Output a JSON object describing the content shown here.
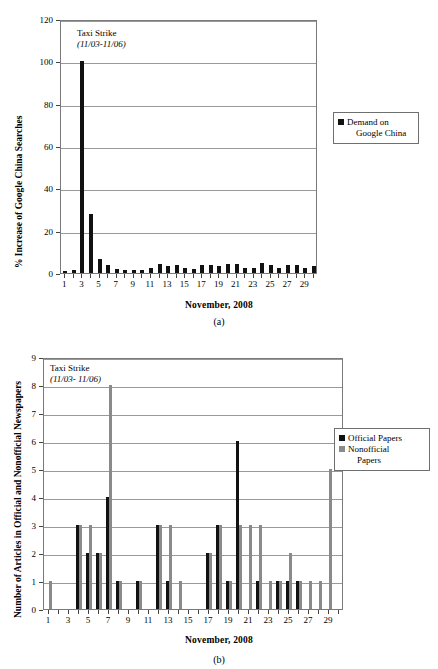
{
  "figure": {
    "caption_a": "(a)",
    "caption_b": "(b)"
  },
  "colors": {
    "official": "#111111",
    "nonofficial": "#8a8a8a",
    "grid": "#9a9a9a",
    "axis": "#555555"
  },
  "chart_data": [
    {
      "id": "chart-a",
      "type": "bar",
      "title": "",
      "xlabel": "November, 2008",
      "ylabel": "% Increase of Google China Searches",
      "ylim": [
        0,
        120
      ],
      "yticks": [
        0,
        20,
        40,
        60,
        80,
        100,
        120
      ],
      "grid": true,
      "legend_position": "right",
      "annotation": {
        "line1": "Taxi Strike",
        "line2": "(11/03-11/06)"
      },
      "legend": [
        {
          "label_line1": "Demand on",
          "label_line2": "Google China",
          "color": "#111111"
        }
      ],
      "categories": [
        1,
        2,
        3,
        4,
        5,
        6,
        7,
        8,
        9,
        10,
        11,
        12,
        13,
        14,
        15,
        16,
        17,
        18,
        19,
        20,
        21,
        22,
        23,
        24,
        25,
        26,
        27,
        28,
        29,
        30
      ],
      "xtick_labels": [
        1,
        3,
        5,
        7,
        9,
        11,
        13,
        15,
        17,
        19,
        21,
        23,
        25,
        27,
        29
      ],
      "series": [
        {
          "name": "Demand on Google China",
          "color": "#111111",
          "values": [
            1.0,
            1.2,
            100.0,
            28.0,
            6.8,
            4.0,
            2.0,
            1.6,
            1.6,
            1.6,
            2.2,
            4.2,
            3.2,
            3.6,
            2.2,
            2.0,
            3.6,
            3.8,
            3.2,
            4.2,
            4.4,
            2.6,
            2.4,
            4.6,
            3.6,
            2.6,
            3.8,
            3.6,
            2.4,
            3.2
          ]
        }
      ]
    },
    {
      "id": "chart-b",
      "type": "bar",
      "title": "",
      "xlabel": "November, 2008",
      "ylabel": "Number of Articles in Official and Nonofficial Newspapers",
      "ylim": [
        0,
        9
      ],
      "yticks": [
        0,
        1,
        2,
        3,
        4,
        5,
        6,
        7,
        8,
        9
      ],
      "grid": true,
      "legend_position": "right",
      "annotation": {
        "line1": "Taxi Strike",
        "line2": "(11/03- 11/06)"
      },
      "legend": [
        {
          "label_line1": "Official Papers",
          "label_line2": "",
          "color": "#111111"
        },
        {
          "label_line1": "Nonofficial",
          "label_line2": "Papers",
          "color": "#8a8a8a"
        }
      ],
      "categories": [
        1,
        2,
        3,
        4,
        5,
        6,
        7,
        8,
        9,
        10,
        11,
        12,
        13,
        14,
        15,
        16,
        17,
        18,
        19,
        20,
        21,
        22,
        23,
        24,
        25,
        26,
        27,
        28,
        29,
        30
      ],
      "xtick_labels": [
        1,
        3,
        5,
        7,
        9,
        11,
        13,
        15,
        17,
        19,
        21,
        23,
        25,
        27,
        29
      ],
      "series": [
        {
          "name": "Official Papers",
          "color": "#111111",
          "values": [
            0,
            0,
            0,
            3,
            2,
            2,
            4,
            1,
            0,
            1,
            0,
            3,
            1,
            0,
            0,
            0,
            2,
            3,
            1,
            6,
            0,
            1,
            0,
            1,
            1,
            1,
            0,
            0,
            0,
            0
          ]
        },
        {
          "name": "Nonofficial Papers",
          "color": "#8a8a8a",
          "values": [
            1,
            0,
            0,
            3,
            3,
            2,
            8,
            1,
            0,
            1,
            0,
            3,
            3,
            1,
            0,
            0,
            2,
            3,
            1,
            3,
            3,
            3,
            1,
            1,
            2,
            1,
            1,
            1,
            5,
            0
          ]
        }
      ]
    }
  ]
}
